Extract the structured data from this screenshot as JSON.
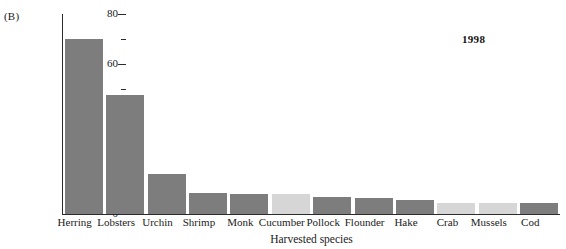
{
  "panel": {
    "label": "(B)"
  },
  "annotation": {
    "year": "1998"
  },
  "chart_data": {
    "type": "bar",
    "title": "",
    "xlabel": "Harvested species",
    "ylabel": "Millions of pounds",
    "ylim": [
      0,
      80
    ],
    "ytick_labels": [
      "0",
      "20",
      "40",
      "60",
      "80"
    ],
    "ytick_values": [
      0,
      20,
      40,
      60,
      80
    ],
    "yminor_values": [
      10,
      30,
      50,
      70
    ],
    "grid": false,
    "legend": "none",
    "categories": [
      "Herring",
      "Lobsters",
      "Urchin",
      "Shrimp",
      "Monk",
      "Cucumber",
      "Pollock",
      "Flounder",
      "Hake",
      "Crab",
      "Mussels",
      "Cod"
    ],
    "values": [
      70,
      47.5,
      16,
      8.5,
      8,
      8,
      7,
      6.5,
      5.5,
      4.5,
      4.5,
      4.5
    ],
    "bar_colors": [
      "#7d7d7d",
      "#7d7d7d",
      "#7d7d7d",
      "#7d7d7d",
      "#7d7d7d",
      "#d6d6d6",
      "#7d7d7d",
      "#7d7d7d",
      "#7d7d7d",
      "#d6d6d6",
      "#d6d6d6",
      "#7d7d7d"
    ],
    "colors": {
      "dark_bar": "#7d7d7d",
      "light_bar": "#d6d6d6",
      "axis": "#2b2b2b",
      "text": "#1a1a1a",
      "background": "#ffffff"
    }
  }
}
